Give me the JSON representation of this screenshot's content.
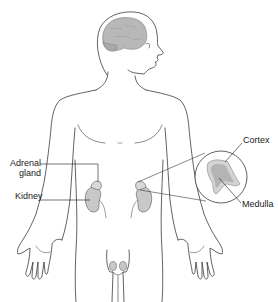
{
  "diagram": {
    "labels": {
      "adrenal_line1": "Adrenal",
      "adrenal_line2": "gland",
      "kidney": "Kidney",
      "cortex": "Cortex",
      "medulla": "Medulla"
    },
    "colors": {
      "outline": "#3a3a3a",
      "organ_fill": "#c8c8c8",
      "brain_fill": "#b8b8b8",
      "cortex_fill": "#d4d4d4",
      "medulla_fill": "#b4b4b4",
      "background": "#ffffff"
    }
  }
}
